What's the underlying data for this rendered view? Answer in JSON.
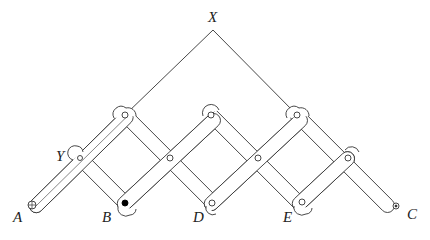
{
  "diagram": {
    "labels": {
      "X": "X",
      "Y": "Y",
      "A": "A",
      "B": "B",
      "C": "C",
      "D": "D",
      "E": "E"
    },
    "colors": {
      "stroke": "#333333",
      "background": "#ffffff",
      "pen": "#000000"
    },
    "points": {
      "X": [
        213,
        30
      ],
      "Y": [
        80,
        158
      ],
      "A": [
        37,
        205
      ],
      "B": [
        125,
        203
      ],
      "C": [
        396,
        206
      ],
      "D": [
        212,
        203
      ],
      "E": [
        300,
        203
      ]
    }
  }
}
